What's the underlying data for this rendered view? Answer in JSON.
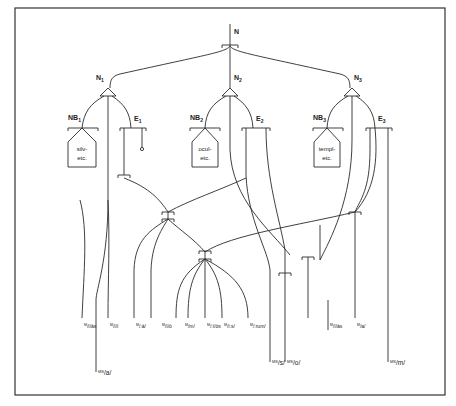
{
  "caption_fragment": "",
  "nodes": {
    "root": {
      "label": "N"
    },
    "n1": {
      "label": "N",
      "sub": "1"
    },
    "n2": {
      "label": "N",
      "sub": "2"
    },
    "n3": {
      "label": "N",
      "sub": "3"
    },
    "nb1": {
      "label": "NB",
      "sub": "1"
    },
    "nb2": {
      "label": "NB",
      "sub": "2"
    },
    "nb3": {
      "label": "NB",
      "sub": "3"
    },
    "e1": {
      "label": "E",
      "sub": "1"
    },
    "e2": {
      "label": "E",
      "sub": "2"
    },
    "e3": {
      "label": "E",
      "sub": "3"
    }
  },
  "stem_boxes": [
    {
      "line1": "silv-",
      "line2": "etc."
    },
    {
      "line1": "ocul-",
      "line2": "etc."
    },
    {
      "line1": "templ-",
      "line2": "etc."
    }
  ],
  "leaves_upper": [
    {
      "sup": "M",
      "text": "/ī/ās"
    },
    {
      "sup": "M",
      "text": "/ī/ī"
    },
    {
      "sup": "M",
      "text": "/:ā/"
    },
    {
      "sup": "M",
      "text": "/ī/ō"
    },
    {
      "sup": "M",
      "text": "/m/"
    },
    {
      "sup": "M",
      "text": "/:ī/ōs"
    },
    {
      "sup": "M",
      "text": "/ī:s/"
    },
    {
      "sup": "M",
      "text": "/:rum/"
    },
    {
      "sup": "M",
      "text": "/ī/ās"
    },
    {
      "sup": "M",
      "text": "/a/"
    }
  ],
  "leaves_lower": [
    {
      "sup": "MS",
      "text": "/a/"
    },
    {
      "sup": "MS",
      "text": "/s/"
    },
    {
      "sup": "MS",
      "text": "/o/"
    },
    {
      "sup": "MS",
      "text": "/m/"
    }
  ]
}
